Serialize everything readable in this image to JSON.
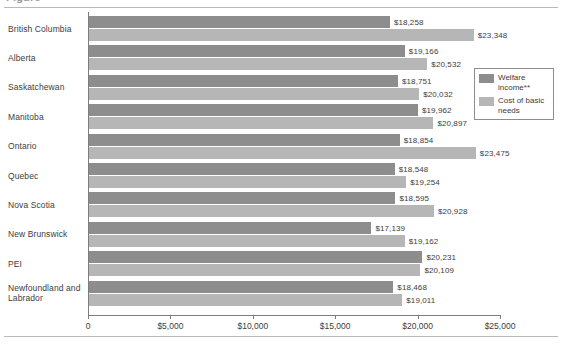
{
  "figure": {
    "title_sliver": "Figure",
    "title_visible": false
  },
  "legend": {
    "position": "top-right",
    "items": [
      {
        "label": "Welfare income**",
        "color": "#8d8d8d",
        "key": "welfare"
      },
      {
        "label": "Cost of basic needs",
        "color": "#b6b6b6",
        "key": "basic"
      }
    ]
  },
  "axis": {
    "tick_labels": [
      "0",
      "$5,000",
      "$10,000",
      "$15,000",
      "$20,000",
      "$25,000"
    ],
    "tick_values": [
      0,
      5000,
      10000,
      15000,
      20000,
      25000
    ]
  },
  "chart_data": {
    "type": "bar",
    "orientation": "horizontal",
    "title": "",
    "xlabel": "",
    "ylabel": "",
    "xlim": [
      0,
      25000
    ],
    "grid": false,
    "legend_position": "top-right",
    "categories": [
      "British Columbia",
      "Alberta",
      "Saskatchewan",
      "Manitoba",
      "Ontario",
      "Quebec",
      "Nova Scotia",
      "New Brunswick",
      "PEI",
      "Newfoundland and Labrador"
    ],
    "series": [
      {
        "name": "Welfare income**",
        "color": "#8d8d8d",
        "values": [
          18258,
          19166,
          18751,
          19962,
          18854,
          18548,
          18595,
          17139,
          20231,
          18468
        ],
        "labels": [
          "$18,258",
          "$19,166",
          "$18,751",
          "$19,962",
          "$18,854",
          "$18,548",
          "$18,595",
          "$17,139",
          "$20,231",
          "$18,468"
        ]
      },
      {
        "name": "Cost of basic needs",
        "color": "#b6b6b6",
        "values": [
          23348,
          20532,
          20032,
          20897,
          23475,
          19254,
          20928,
          19162,
          20109,
          19011
        ],
        "labels": [
          "$23,348",
          "$20,532",
          "$20,032",
          "$20,897",
          "$23,475",
          "$19,254",
          "$20,928",
          "$19,162",
          "$20,109",
          "$19,011"
        ]
      }
    ],
    "axis_ticks": [
      0,
      5000,
      10000,
      15000,
      20000,
      25000
    ],
    "axis_tick_labels": [
      "0",
      "$5,000",
      "$10,000",
      "$15,000",
      "$20,000",
      "$25,000"
    ]
  }
}
